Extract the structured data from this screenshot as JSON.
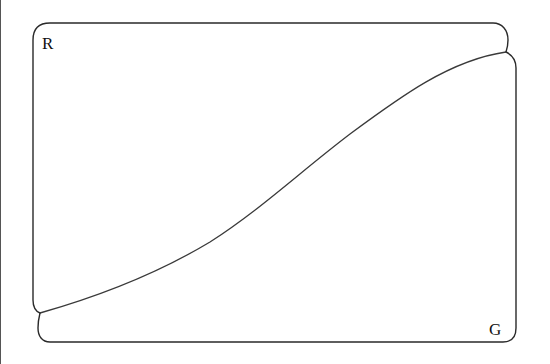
{
  "diagram": {
    "type": "region-partition",
    "regions": [
      {
        "id": "upper-left",
        "label": "R"
      },
      {
        "id": "lower-right",
        "label": "G"
      }
    ],
    "stroke_color": "#2a2a2a",
    "background": "#ffffff"
  }
}
